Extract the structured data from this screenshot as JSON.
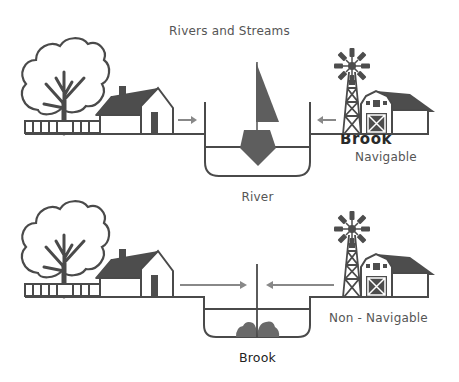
{
  "diagram": {
    "title": "Rivers and Streams",
    "panels": [
      {
        "name": "River",
        "caption": "River",
        "side_label": "Navigable",
        "overlapping_label": "Brook",
        "features": [
          "tree",
          "fence",
          "house",
          "inflow-arrow-left",
          "channel",
          "water-line",
          "sailboat",
          "inflow-arrow-right",
          "windmill",
          "barn"
        ]
      },
      {
        "name": "Brook",
        "caption": "Brook",
        "side_label": "Non - Navigable",
        "features": [
          "tree",
          "fence",
          "house",
          "inflow-arrow-left",
          "channel",
          "water-line",
          "pole",
          "rocks",
          "inflow-arrow-right",
          "windmill",
          "barn"
        ]
      }
    ],
    "colors": {
      "line": "#4a4a4a",
      "fill_dark": "#4d4d4d",
      "boat": "#5e5e5e",
      "arrow": "#888888",
      "text": "#555555",
      "background": "#ffffff"
    }
  }
}
